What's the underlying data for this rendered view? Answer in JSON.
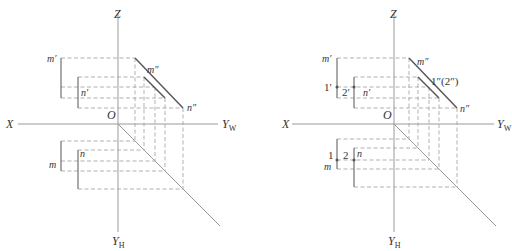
{
  "figure": {
    "colors": {
      "axis": "#9a9a9a",
      "line": "#555555",
      "construction": "#a8a8a8",
      "text": "#333333"
    }
  },
  "left_diagram": {
    "axes": {
      "z": "Z",
      "x": "X",
      "o": "O",
      "yw": "Y",
      "yw_sub": "W",
      "yh": "Y",
      "yh_sub": "H"
    },
    "labels": {
      "m_prime": "m′",
      "n_prime": "n′",
      "m_dprime": "m″",
      "n_dprime": "n″",
      "m": "m",
      "n": "n"
    }
  },
  "right_diagram": {
    "axes": {
      "z": "Z",
      "x": "X",
      "o": "O",
      "yw": "Y",
      "yw_sub": "W",
      "yh": "Y",
      "yh_sub": "H"
    },
    "labels": {
      "m_prime": "m′",
      "n_prime": "n′",
      "m_dprime": "m″",
      "n_dprime": "n″",
      "one_two_dprime": "1″(2″)",
      "one_prime": "1′",
      "two_prime": "2′",
      "m": "m",
      "n": "n",
      "one": "1",
      "two": "2"
    }
  }
}
